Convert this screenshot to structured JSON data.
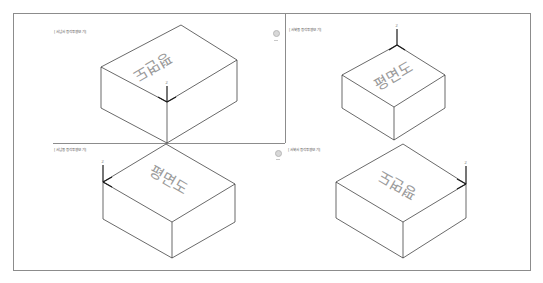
{
  "viewports": [
    {
      "id": "top-left",
      "label": "[서남서 등각투영보기]",
      "top_text": "평면도",
      "axis": "z-up-x-y"
    },
    {
      "id": "top-right",
      "label": "[서북동 등각투영보기]",
      "top_text": "평면도",
      "axis": "z-up"
    },
    {
      "id": "bottom-left",
      "label": "[서남동 등각투영보기]",
      "top_text": "평면도",
      "axis": "z-left"
    },
    {
      "id": "bottom-right",
      "label": "[서북서 등각투영보기]",
      "top_text": "평면도",
      "axis": "z-right"
    }
  ],
  "axis_labels": {
    "z": "Z",
    "x": "X",
    "y": "Y"
  },
  "colors": {
    "frame": "#8c8c8c",
    "edge": "#2a2a2a",
    "text": "#9a9a9a",
    "axis": "#1a1a1a"
  }
}
